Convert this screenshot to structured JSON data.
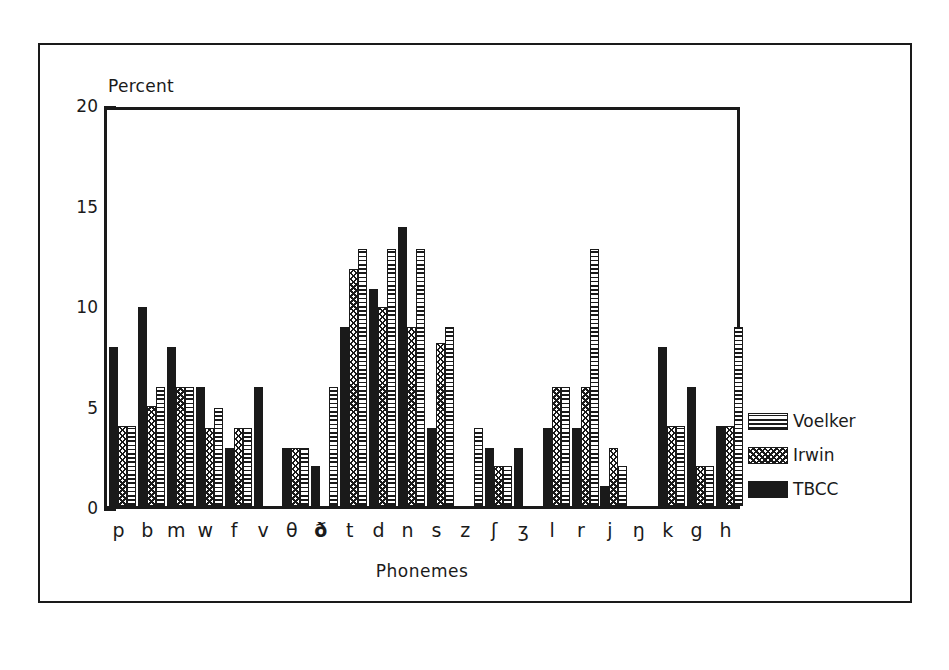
{
  "figure": {
    "frame_color": "#1a1a1a",
    "background": "#ffffff"
  },
  "chart_data": {
    "type": "bar",
    "title": "",
    "subtitle": "",
    "xlabel": "Phonemes",
    "ylabel": "Percent",
    "ylim": [
      0,
      20
    ],
    "y_ticks_major": [
      0,
      5,
      10,
      15,
      20
    ],
    "y_tick_labels": [
      "0",
      "5",
      "10",
      "15",
      "20"
    ],
    "y_minor_tick_step": 1,
    "grid": false,
    "legend_position": "right",
    "bar_order_in_group": [
      "TBCC",
      "Irwin",
      "Voelker"
    ],
    "categories": [
      "p",
      "b",
      "m",
      "w",
      "f",
      "v",
      "θ",
      "ð",
      "t",
      "d",
      "n",
      "s",
      "z",
      "ʃ",
      "ʒ",
      "l",
      "r",
      "j",
      "ŋ",
      "k",
      "g",
      "h"
    ],
    "series": [
      {
        "name": "Voelker",
        "pattern": "horizontal-lines",
        "color": "#1a1a1a",
        "values": [
          4.0,
          5.9,
          5.9,
          4.9,
          3.9,
          0.0,
          2.9,
          5.9,
          12.8,
          12.8,
          12.8,
          8.9,
          3.9,
          2.0,
          0.0,
          5.9,
          12.8,
          2.0,
          0.0,
          4.0,
          2.0,
          8.9
        ]
      },
      {
        "name": "Irwin",
        "pattern": "cross-hatch",
        "color": "#1a1a1a",
        "values": [
          4.0,
          5.0,
          5.9,
          3.9,
          3.9,
          0.0,
          2.9,
          0.0,
          11.8,
          9.9,
          8.9,
          8.1,
          0.0,
          2.0,
          0.0,
          5.9,
          5.9,
          2.9,
          0.0,
          4.0,
          2.0,
          4.0
        ]
      },
      {
        "name": "TBCC",
        "pattern": "solid",
        "color": "#1a1a1a",
        "values": [
          7.9,
          9.9,
          7.9,
          5.9,
          2.9,
          5.9,
          2.9,
          2.0,
          8.9,
          10.8,
          13.9,
          3.9,
          0.0,
          2.9,
          2.9,
          3.9,
          3.9,
          1.0,
          0.0,
          7.9,
          5.9,
          4.0
        ]
      }
    ]
  },
  "legend": {
    "entries": [
      {
        "label": "Voelker",
        "pattern": "voelker"
      },
      {
        "label": "Irwin",
        "pattern": "irwin"
      },
      {
        "label": "TBCC",
        "pattern": "tbcc"
      }
    ]
  }
}
